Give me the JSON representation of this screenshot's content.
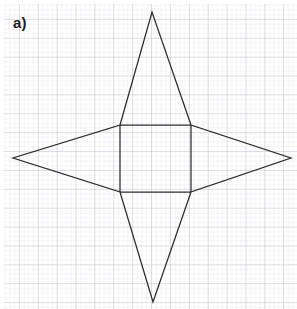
{
  "figure": {
    "label": "a)",
    "background": "graph-paper",
    "paper": {
      "bg_color": "#ffffff",
      "minor_line_color": "#dedbe8",
      "major_line_color": "#c6c2d4",
      "minor_spacing_px": 4.72,
      "major_every": 4,
      "margin_px": 4
    },
    "drawing": {
      "stroke_color": "#2b2b2b",
      "stroke_width_px": 1.25,
      "fill": "none",
      "description": "four-pointed star net: central square with four isosceles triangles attached to each side"
    }
  },
  "chart_data": {
    "type": "diagram",
    "title": "a)",
    "shape": "four-pointed star (square with four triangular points)",
    "units": "pixels",
    "canvas": {
      "width": 297,
      "height": 309
    },
    "square": {
      "name": "central-square",
      "left": 120,
      "top": 125,
      "right": 191,
      "bottom": 192,
      "width": 71,
      "height": 67
    },
    "apexes": {
      "top": {
        "x": 152,
        "y": 12
      },
      "bottom": {
        "x": 153,
        "y": 302
      },
      "left": {
        "x": 13,
        "y": 158
      },
      "right": {
        "x": 291,
        "y": 158
      }
    },
    "outline_points": [
      [
        120,
        125
      ],
      [
        152,
        12
      ],
      [
        191,
        125
      ],
      [
        291,
        158
      ],
      [
        191,
        192
      ],
      [
        153,
        302
      ],
      [
        120,
        192
      ],
      [
        13,
        158
      ]
    ],
    "inner_edges": [
      {
        "name": "square-top-edge",
        "x1": 120,
        "y1": 125,
        "x2": 191,
        "y2": 125
      },
      {
        "name": "square-right-edge",
        "x1": 191,
        "y1": 125,
        "x2": 191,
        "y2": 192
      },
      {
        "name": "square-bottom-edge",
        "x1": 120,
        "y1": 192,
        "x2": 191,
        "y2": 192
      },
      {
        "name": "square-left-edge",
        "x1": 120,
        "y1": 125,
        "x2": 120,
        "y2": 192
      }
    ],
    "triangles": [
      {
        "name": "top-point",
        "base": [
          [
            120,
            125
          ],
          [
            191,
            125
          ]
        ],
        "apex": [
          152,
          12
        ]
      },
      {
        "name": "bottom-point",
        "base": [
          [
            120,
            192
          ],
          [
            191,
            192
          ]
        ],
        "apex": [
          153,
          302
        ]
      },
      {
        "name": "left-point",
        "base": [
          [
            120,
            125
          ],
          [
            120,
            192
          ]
        ],
        "apex": [
          13,
          158
        ]
      },
      {
        "name": "right-point",
        "base": [
          [
            191,
            125
          ],
          [
            191,
            192
          ]
        ],
        "apex": [
          291,
          158
        ]
      }
    ]
  }
}
